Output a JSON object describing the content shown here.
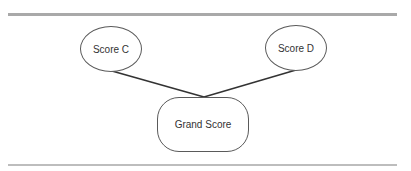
{
  "diagram": {
    "nodes": [
      {
        "id": "score_c",
        "label": "Score C",
        "shape": "ellipse"
      },
      {
        "id": "score_d",
        "label": "Score D",
        "shape": "ellipse"
      },
      {
        "id": "grand_score",
        "label": "Grand Score",
        "shape": "rounded-rectangle"
      }
    ],
    "edges": [
      {
        "from": "score_c",
        "to": "grand_score"
      },
      {
        "from": "score_d",
        "to": "grand_score"
      }
    ],
    "colors": {
      "rule": "#a9a9a9",
      "edge": "#333333",
      "node_border": "#5a5a5a",
      "text": "#333333"
    }
  }
}
